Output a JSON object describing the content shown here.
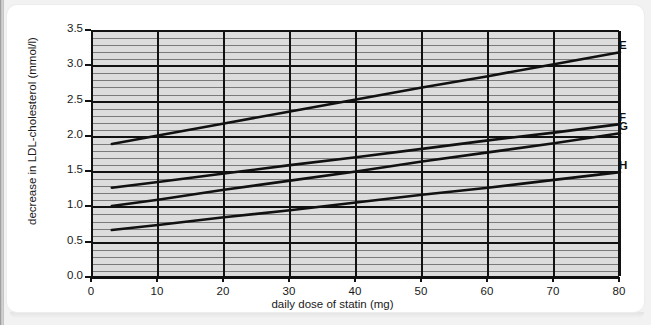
{
  "chart_data": {
    "type": "line",
    "title": "",
    "xlabel": "daily dose of statin (mg)",
    "ylabel": "decrease in LDL-cholesterol (mmol/l)",
    "xlim": [
      0,
      80
    ],
    "ylim": [
      0.0,
      3.5
    ],
    "xticks": [
      "0",
      "10",
      "20",
      "30",
      "40",
      "50",
      "60",
      "70",
      "80"
    ],
    "yticks": [
      "0.0",
      "0.5",
      "1.0",
      "1.5",
      "2.0",
      "2.5",
      "3.0",
      "3.5"
    ],
    "x_major_step": 10,
    "y_major_step": 0.5,
    "y_minor_step": 0.1,
    "grid": true,
    "grid_color": "#111111",
    "minor_grid_color": "#7a7a7a",
    "plot_background": "#dcdcdc",
    "line_color": "#111111",
    "legend_position": "right-end-of-line",
    "series": [
      {
        "name": "E",
        "label": "E",
        "x": [
          3,
          80
        ],
        "y": [
          1.9,
          3.2
        ],
        "points": [
          {
            "x": 3,
            "y": 1.9
          },
          {
            "x": 10,
            "y": 2.02
          },
          {
            "x": 20,
            "y": 2.19
          },
          {
            "x": 30,
            "y": 2.36
          },
          {
            "x": 40,
            "y": 2.53
          },
          {
            "x": 50,
            "y": 2.7
          },
          {
            "x": 60,
            "y": 2.86
          },
          {
            "x": 70,
            "y": 3.03
          },
          {
            "x": 80,
            "y": 3.2
          }
        ]
      },
      {
        "name": "F",
        "label": "F",
        "x": [
          3,
          80
        ],
        "y": [
          1.28,
          2.18
        ],
        "points": [
          {
            "x": 3,
            "y": 1.28
          },
          {
            "x": 10,
            "y": 1.36
          },
          {
            "x": 20,
            "y": 1.48
          },
          {
            "x": 30,
            "y": 1.6
          },
          {
            "x": 40,
            "y": 1.71
          },
          {
            "x": 50,
            "y": 1.83
          },
          {
            "x": 60,
            "y": 1.95
          },
          {
            "x": 70,
            "y": 2.06
          },
          {
            "x": 80,
            "y": 2.18
          }
        ]
      },
      {
        "name": "G",
        "label": "G",
        "x": [
          3,
          80
        ],
        "y": [
          1.02,
          2.05
        ],
        "points": [
          {
            "x": 3,
            "y": 1.02
          },
          {
            "x": 10,
            "y": 1.11
          },
          {
            "x": 20,
            "y": 1.25
          },
          {
            "x": 30,
            "y": 1.38
          },
          {
            "x": 40,
            "y": 1.51
          },
          {
            "x": 50,
            "y": 1.65
          },
          {
            "x": 60,
            "y": 1.78
          },
          {
            "x": 70,
            "y": 1.91
          },
          {
            "x": 80,
            "y": 2.05
          }
        ]
      },
      {
        "name": "H",
        "label": "H",
        "x": [
          3,
          80
        ],
        "y": [
          0.68,
          1.5
        ],
        "points": [
          {
            "x": 3,
            "y": 0.68
          },
          {
            "x": 10,
            "y": 0.75
          },
          {
            "x": 20,
            "y": 0.86
          },
          {
            "x": 30,
            "y": 0.96
          },
          {
            "x": 40,
            "y": 1.07
          },
          {
            "x": 50,
            "y": 1.18
          },
          {
            "x": 60,
            "y": 1.28
          },
          {
            "x": 70,
            "y": 1.39
          },
          {
            "x": 80,
            "y": 1.5
          }
        ]
      }
    ]
  }
}
